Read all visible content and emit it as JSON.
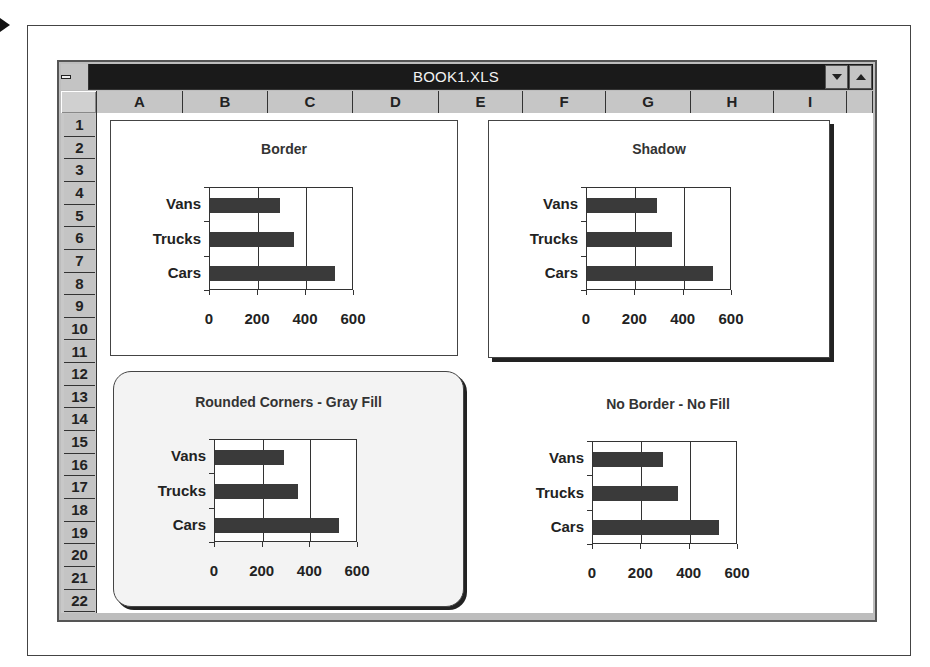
{
  "window": {
    "title": "BOOK1.XLS",
    "controls": {
      "system_menu": "system-menu",
      "minimize": "minimize",
      "maximize": "maximize"
    }
  },
  "columns": [
    "A",
    "B",
    "C",
    "D",
    "E",
    "F",
    "G",
    "H",
    "I"
  ],
  "rows": [
    "1",
    "2",
    "3",
    "4",
    "5",
    "6",
    "7",
    "8",
    "9",
    "10",
    "11",
    "12",
    "13",
    "14",
    "15",
    "16",
    "17",
    "18",
    "19",
    "20",
    "21",
    "22"
  ],
  "charts": [
    {
      "title": "Border",
      "style": "border",
      "categories": [
        "Vans",
        "Trucks",
        "Cars"
      ],
      "x_ticks": [
        "0",
        "200",
        "400",
        "600"
      ]
    },
    {
      "title": "Shadow",
      "style": "shadow",
      "categories": [
        "Vans",
        "Trucks",
        "Cars"
      ],
      "x_ticks": [
        "0",
        "200",
        "400",
        "600"
      ]
    },
    {
      "title": "Rounded Corners - Gray Fill",
      "style": "rounded",
      "categories": [
        "Vans",
        "Trucks",
        "Cars"
      ],
      "x_ticks": [
        "0",
        "200",
        "400",
        "600"
      ]
    },
    {
      "title": "No Border - No Fill",
      "style": "plain",
      "categories": [
        "Vans",
        "Trucks",
        "Cars"
      ],
      "x_ticks": [
        "0",
        "200",
        "400",
        "600"
      ]
    }
  ],
  "chart_data": [
    {
      "type": "bar",
      "orientation": "horizontal",
      "title": "Border",
      "categories": [
        "Vans",
        "Trucks",
        "Cars"
      ],
      "values": [
        290,
        350,
        520
      ],
      "xlabel": "",
      "ylabel": "",
      "xlim": [
        0,
        600
      ],
      "x_ticks": [
        0,
        200,
        400,
        600
      ],
      "grid": true,
      "legend": "none"
    },
    {
      "type": "bar",
      "orientation": "horizontal",
      "title": "Shadow",
      "categories": [
        "Vans",
        "Trucks",
        "Cars"
      ],
      "values": [
        290,
        350,
        520
      ],
      "xlabel": "",
      "ylabel": "",
      "xlim": [
        0,
        600
      ],
      "x_ticks": [
        0,
        200,
        400,
        600
      ],
      "grid": true,
      "legend": "none"
    },
    {
      "type": "bar",
      "orientation": "horizontal",
      "title": "Rounded Corners - Gray Fill",
      "categories": [
        "Vans",
        "Trucks",
        "Cars"
      ],
      "values": [
        290,
        350,
        520
      ],
      "xlabel": "",
      "ylabel": "",
      "xlim": [
        0,
        600
      ],
      "x_ticks": [
        0,
        200,
        400,
        600
      ],
      "grid": true,
      "legend": "none"
    },
    {
      "type": "bar",
      "orientation": "horizontal",
      "title": "No Border - No Fill",
      "categories": [
        "Vans",
        "Trucks",
        "Cars"
      ],
      "values": [
        290,
        350,
        520
      ],
      "xlabel": "",
      "ylabel": "",
      "xlim": [
        0,
        600
      ],
      "x_ticks": [
        0,
        200,
        400,
        600
      ],
      "grid": true,
      "legend": "none"
    }
  ],
  "colors": {
    "titlebar": "#1a1a1a",
    "header_gray": "#c6c6c6",
    "bar_fill": "#3a3a3a",
    "rounded_fill": "#f3f3f3"
  }
}
